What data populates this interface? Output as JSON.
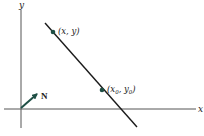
{
  "diagram": {
    "axes": {
      "x_label": "x",
      "y_label": "y",
      "origin": [
        21,
        109
      ]
    },
    "line": {
      "from": [
        45,
        23
      ],
      "to": [
        137,
        127
      ],
      "color": "#1a1a1a"
    },
    "points": [
      {
        "label": "(x, y)",
        "position": [
          53,
          31
        ]
      },
      {
        "label_main": "(x",
        "label_sub0": "0",
        "label_mid": ", y",
        "label_sub1": "0",
        "label_end": ")",
        "position": [
          102,
          90
        ]
      }
    ],
    "normal_vector": {
      "label": "N",
      "from": [
        21,
        108
      ],
      "to": [
        37,
        94
      ],
      "color": "#1f4f45"
    },
    "accent_color": "#1f4f45"
  }
}
